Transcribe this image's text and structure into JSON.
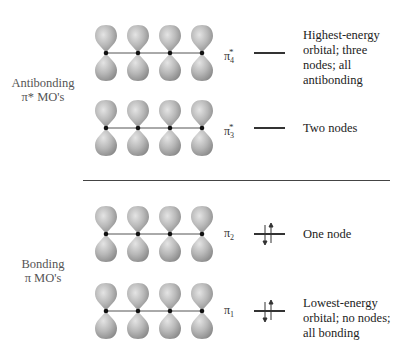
{
  "figure": {
    "type": "molecular-orbital-diagram",
    "group_labels": {
      "antibonding": [
        "Antibonding",
        "π* MO's"
      ],
      "bonding": [
        "Bonding",
        "π MO's"
      ]
    },
    "orbitals": [
      {
        "id": "pi4star",
        "symbol": "π",
        "subscript": "4",
        "superscript": "*",
        "electrons": 0,
        "description": [
          "Highest-energy",
          "orbital; three",
          "nodes; all",
          "antibonding"
        ],
        "top_lobe_shade": [
          "light",
          "light",
          "light",
          "light"
        ]
      },
      {
        "id": "pi3star",
        "symbol": "π",
        "subscript": "3",
        "superscript": "*",
        "electrons": 0,
        "description": [
          "Two nodes"
        ]
      },
      {
        "id": "pi2",
        "symbol": "π",
        "subscript": "2",
        "superscript": "",
        "electrons": 2,
        "description": [
          "One node"
        ]
      },
      {
        "id": "pi1",
        "symbol": "π",
        "subscript": "1",
        "superscript": "",
        "electrons": 2,
        "description": [
          "Lowest-energy",
          "orbital; no nodes;",
          "all bonding"
        ]
      }
    ],
    "atoms_per_orbital": 4,
    "colors": {
      "lobe": "#b5b5b5",
      "lobe_highlight": "#e2e2e2",
      "lobe_shadow": "#8a8a8a",
      "nucleus": "#111111",
      "line": "#333333"
    }
  }
}
